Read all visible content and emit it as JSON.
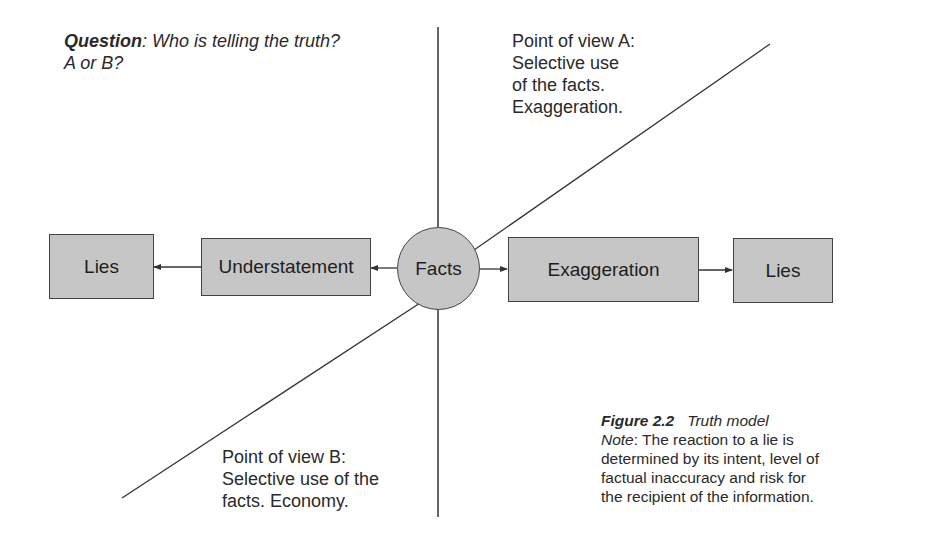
{
  "question": {
    "label": "Question",
    "separator": ":",
    "text_line1": " Who is telling the truth?",
    "text_line2": "A or B?"
  },
  "point_of_view_a": {
    "lines": [
      "Point of view A:",
      "Selective use",
      "of the facts.",
      "Exaggeration."
    ]
  },
  "point_of_view_b": {
    "lines": [
      "Point of view B:",
      "Selective use of the",
      "facts. Economy."
    ]
  },
  "nodes": {
    "lies_left": "Lies",
    "understatement": "Understatement",
    "facts": "Facts",
    "exaggeration": "Exaggeration",
    "lies_right": "Lies"
  },
  "caption": {
    "figure_label": "Figure 2.2",
    "figure_title": "Truth model",
    "note_label": "Note",
    "note_lines": [
      ": The reaction to a lie is",
      "determined by its intent, level of",
      "factual inaccuracy and risk for",
      "the recipient of the information."
    ]
  },
  "colors": {
    "node_fill": "#c6c6c6",
    "stroke": "#444444",
    "text": "#222222"
  }
}
